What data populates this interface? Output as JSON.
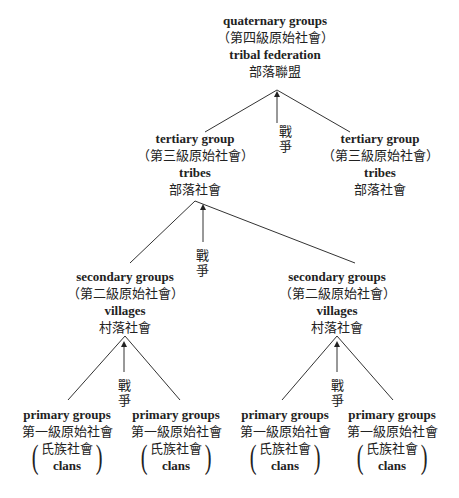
{
  "diagram": {
    "type": "hierarchy-tree",
    "edge_label": "戰爭",
    "level4": {
      "en": "quaternary groups",
      "zh_level": "（第四級原始社會）",
      "en2": "tribal federation",
      "zh": "部落聯盟"
    },
    "level3": [
      {
        "en": "tertiary group",
        "zh_level": "（第三級原始社會）",
        "en2": "tribes",
        "zh": "部落社會"
      },
      {
        "en": "tertiary group",
        "zh_level": "（第三級原始社會）",
        "en2": "tribes",
        "zh": "部落社會"
      }
    ],
    "level2": [
      {
        "en": "secondary groups",
        "zh_level": "（第二級原始社會）",
        "en2": "villages",
        "zh": "村落社會"
      },
      {
        "en": "secondary groups",
        "zh_level": "（第二級原始社會）",
        "en2": "villages",
        "zh": "村落社會"
      }
    ],
    "level1": [
      {
        "en": "primary groups",
        "zh_level": "第一級原始社會",
        "zh": "氏族社會",
        "en2": "clans"
      },
      {
        "en": "primary groups",
        "zh_level": "第一級原始社會",
        "zh": "氏族社會",
        "en2": "clans"
      },
      {
        "en": "primary groups",
        "zh_level": "第一級原始社會",
        "zh": "氏族社會",
        "en2": "clans"
      },
      {
        "en": "primary groups",
        "zh_level": "第一級原始社會",
        "zh": "氏族社會",
        "en2": "clans"
      }
    ],
    "paren_open": "(",
    "paren_close": ")"
  }
}
